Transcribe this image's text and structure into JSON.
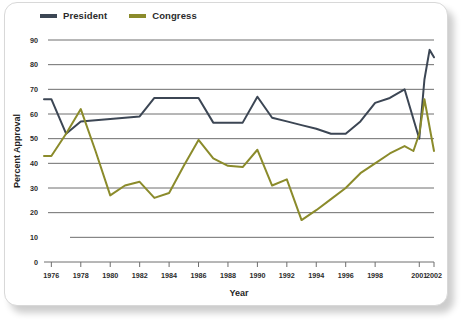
{
  "card": {
    "background": "#ffffff",
    "border_color": "#d8d8d8"
  },
  "legend": {
    "position": "top-left",
    "entries": [
      {
        "label": "President",
        "color": "#3c4654",
        "swatch": "line-swatch-president"
      },
      {
        "label": "Congress",
        "color": "#8b8b2b",
        "swatch": "line-swatch-congress"
      }
    ]
  },
  "chart_data": {
    "type": "line",
    "title": "",
    "subtitle": "",
    "xlabel": "Year",
    "ylabel": "Percent Approval",
    "xlim": [
      1975.5,
      2002
    ],
    "ylim": [
      0,
      90
    ],
    "yticks": [
      0,
      10,
      20,
      30,
      40,
      50,
      60,
      70,
      80,
      90
    ],
    "ytick_labels": [
      "0",
      "10",
      "20",
      "30",
      "40",
      "50",
      "60",
      "70",
      "80",
      "90"
    ],
    "xticks": [
      1976,
      1978,
      1980,
      1982,
      1984,
      1986,
      1988,
      1990,
      1992,
      1994,
      1996,
      1998,
      2001,
      2002
    ],
    "xtick_labels": [
      "1976",
      "1978",
      "1980",
      "1982",
      "1984",
      "1986",
      "1988",
      "1990",
      "1992",
      "1994",
      "1996",
      "1998",
      "2001",
      "2002"
    ],
    "grid": "horizontal",
    "grid_color": "#6e6e6e",
    "legend_position": "top-left",
    "x": [
      1975.5,
      1976,
      1977,
      1977.5,
      1978,
      1979,
      1980,
      1981,
      1982,
      1983,
      1984,
      1985,
      1986,
      1987,
      1988,
      1989,
      1990,
      1991,
      1992,
      1993,
      1994,
      1995,
      1996,
      1997,
      1998,
      1999,
      2000,
      2000.5,
      2001,
      2001.35,
      2001.7,
      2002
    ],
    "series": [
      {
        "name": "President",
        "color": "#3c4654",
        "x": [
          1975.5,
          1976,
          1977,
          1978,
          1979,
          1980,
          1981,
          1982,
          1983,
          1984,
          1985,
          1986,
          1987,
          1988,
          1989,
          1990,
          1991,
          1992,
          1993,
          1994,
          1995,
          1996,
          1997,
          1998,
          1999,
          2000,
          2000.6,
          2001.0,
          2001.35,
          2001.7,
          2002
        ],
        "values": [
          66,
          66,
          52,
          57,
          57.5,
          58,
          58.5,
          59,
          66.5,
          66.5,
          66.5,
          66.5,
          56.5,
          56.5,
          56.5,
          67,
          58.5,
          57,
          55.5,
          54,
          52,
          52,
          57,
          64.5,
          66.5,
          70,
          58,
          50,
          74,
          86,
          83
        ]
      },
      {
        "name": "Congress",
        "color": "#8b8b2b",
        "x": [
          1975.5,
          1976,
          1977,
          1978,
          1979,
          1980,
          1981,
          1982,
          1983,
          1984,
          1985,
          1986,
          1987,
          1988,
          1989,
          1990,
          1991,
          1992,
          1993,
          1994,
          1995,
          1996,
          1997,
          1998,
          1999,
          2000,
          2000.6,
          2001.0,
          2001.35,
          2002
        ],
        "values": [
          43,
          43,
          52,
          62,
          45,
          27,
          31,
          32.5,
          26,
          28,
          39,
          49.5,
          42,
          39,
          38.5,
          45.5,
          31,
          33.5,
          17,
          21,
          25.5,
          30,
          36,
          40,
          44,
          47,
          45,
          52,
          66,
          45
        ]
      }
    ]
  }
}
